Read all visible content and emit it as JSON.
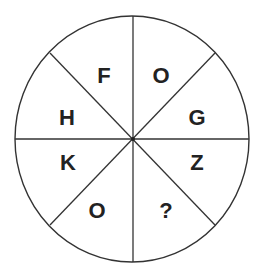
{
  "puzzle": {
    "type": "letter-wheel",
    "segments": 8,
    "center": {
      "x": 133,
      "y": 139
    },
    "radius": {
      "x": 117,
      "y": 123
    },
    "line_color": "#333333",
    "text_color": "#222222",
    "background": "#ffffff",
    "sectors": [
      {
        "position": "top-left",
        "label": "F",
        "x": 104,
        "y": 76
      },
      {
        "position": "top-right",
        "label": "O",
        "x": 161,
        "y": 76
      },
      {
        "position": "right-upper",
        "label": "G",
        "x": 197,
        "y": 118
      },
      {
        "position": "right-lower",
        "label": "Z",
        "x": 197,
        "y": 163
      },
      {
        "position": "bottom-right",
        "label": "?",
        "x": 166,
        "y": 211
      },
      {
        "position": "bottom-left",
        "label": "O",
        "x": 97,
        "y": 211
      },
      {
        "position": "left-lower",
        "label": "K",
        "x": 68,
        "y": 163
      },
      {
        "position": "left-upper",
        "label": "H",
        "x": 67,
        "y": 118
      }
    ]
  }
}
